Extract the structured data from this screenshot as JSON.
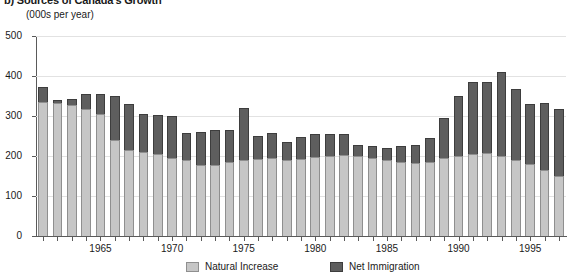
{
  "figure": {
    "title": "b) Sources of Canada's Growth",
    "subtitle": "(000s per year)"
  },
  "legend": {
    "items": [
      {
        "label": "Natural Increase",
        "swatch": "natural-increase-swatch",
        "color": "#c6c6c6"
      },
      {
        "label": "Net Immigration",
        "swatch": "net-immigration-swatch",
        "color": "#5e5e5e"
      }
    ]
  },
  "axes": {
    "y_ticks": [
      "500",
      "400",
      "300",
      "200",
      "100",
      "0"
    ],
    "x_labels": [
      "1965",
      "1970",
      "1975",
      "1980",
      "1985",
      "1990",
      "1995"
    ]
  },
  "chart_data": {
    "type": "bar",
    "title": "b) Sources of Canada's Growth",
    "subtitle": "(000s per year)",
    "xlabel": "",
    "ylabel": "(000s per year)",
    "ylim": [
      0,
      500
    ],
    "yticks": [
      0,
      100,
      200,
      300,
      400,
      500
    ],
    "grid": true,
    "stacked": true,
    "legend_position": "bottom",
    "categories": [
      "1961",
      "1962",
      "1963",
      "1964",
      "1965",
      "1966",
      "1967",
      "1968",
      "1969",
      "1970",
      "1971",
      "1972",
      "1973",
      "1974",
      "1975",
      "1976",
      "1977",
      "1978",
      "1979",
      "1980",
      "1981",
      "1982",
      "1983",
      "1984",
      "1985",
      "1986",
      "1987",
      "1988",
      "1989",
      "1990",
      "1991",
      "1992",
      "1993",
      "1994",
      "1995",
      "1996",
      "1997"
    ],
    "series": [
      {
        "name": "Natural Increase",
        "color": "#c6c6c6",
        "values": [
          334,
          333,
          327,
          318,
          305,
          239,
          214,
          209,
          205,
          196,
          190,
          178,
          178,
          184,
          189,
          192,
          194,
          190,
          193,
          197,
          199,
          203,
          200,
          196,
          190,
          186,
          183,
          186,
          196,
          200,
          205,
          208,
          200,
          190,
          180,
          165,
          150
        ]
      },
      {
        "name": "Net Immigration",
        "color": "#5e5e5e",
        "values": [
          38,
          8,
          16,
          38,
          50,
          110,
          116,
          96,
          97,
          104,
          67,
          81,
          86,
          80,
          130,
          58,
          64,
          45,
          55,
          59,
          57,
          52,
          28,
          30,
          31,
          40,
          45,
          58,
          98,
          151,
          180,
          178,
          209,
          177,
          150,
          167,
          167
        ]
      }
    ],
    "totals": [
      372,
      341,
      343,
      356,
      355,
      349,
      330,
      305,
      302,
      300,
      257,
      259,
      264,
      264,
      319,
      250,
      258,
      235,
      248,
      256,
      256,
      255,
      228,
      226,
      221,
      226,
      228,
      244,
      294,
      351,
      385,
      386,
      409,
      367,
      330,
      332,
      317
    ]
  }
}
